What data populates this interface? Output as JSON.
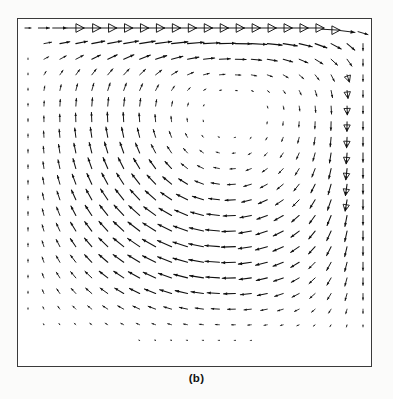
{
  "figure": {
    "caption": "(b)",
    "title": "",
    "frame": {
      "x": 17,
      "y": 18,
      "width": 355,
      "height": 349,
      "border_color": "#3a3a3a",
      "background": "#ffffff"
    },
    "page_background": "#fbfbfa",
    "vector_color": "#111111"
  },
  "chart_data": {
    "type": "scatter",
    "plot_kind": "vector-field-quiver",
    "title": "",
    "subtitle": "",
    "xlabel": "",
    "ylabel": "",
    "xlim": [
      0,
      1
    ],
    "ylim": [
      0,
      1
    ],
    "grid": false,
    "legend": null,
    "annotations": [
      "(b)"
    ],
    "tick_labels": {
      "x": [],
      "y": []
    },
    "grid_nx": 22,
    "grid_ny": 22,
    "vortex_center": {
      "x": 0.605,
      "y": 0.735
    },
    "lid_velocity": {
      "u": 1.0,
      "v": 0.0
    },
    "lid_arrow_style": "large open triangular arrowheads",
    "max_arrow_length_px": 17,
    "reynolds_regime": "primary vortex only, no visible secondary corner eddies",
    "series": [
      {
        "name": "lid row (y = 1.0)",
        "u": [
          0.34,
          0.62,
          0.8,
          0.92,
          1.0,
          1.0,
          1.0,
          1.0,
          1.0,
          1.0,
          1.0,
          1.0,
          1.0,
          1.0,
          1.0,
          1.0,
          1.0,
          1.0,
          1.0,
          1.0,
          0.88,
          0.55
        ],
        "v": [
          0.1,
          0.04,
          0.02,
          0.01,
          0.0,
          0.0,
          0.0,
          0.0,
          0.0,
          0.0,
          0.0,
          0.0,
          0.0,
          0.0,
          0.0,
          0.0,
          0.0,
          0.0,
          0.0,
          -0.02,
          -0.12,
          -0.28
        ]
      },
      {
        "name": "shear layer row (y = 0.95)",
        "u": [
          0.06,
          0.12,
          0.2,
          0.3,
          0.4,
          0.5,
          0.58,
          0.66,
          0.72,
          0.76,
          0.8,
          0.82,
          0.84,
          0.85,
          0.85,
          0.84,
          0.82,
          0.76,
          0.66,
          0.5,
          0.28,
          0.08
        ],
        "v": [
          0.16,
          0.2,
          0.22,
          0.22,
          0.2,
          0.17,
          0.14,
          0.11,
          0.08,
          0.06,
          0.04,
          0.02,
          0.0,
          -0.02,
          -0.05,
          -0.09,
          -0.15,
          -0.24,
          -0.36,
          -0.48,
          -0.52,
          -0.4
        ]
      },
      {
        "name": "upper-mid row (y = 0.80)",
        "u": [
          0.03,
          0.07,
          0.12,
          0.18,
          0.25,
          0.32,
          0.38,
          0.42,
          0.44,
          0.42,
          0.36,
          0.26,
          0.14,
          0.02,
          -0.08,
          -0.16,
          -0.2,
          -0.2,
          -0.16,
          -0.1,
          -0.04,
          -0.01
        ],
        "v": [
          0.12,
          0.18,
          0.22,
          0.25,
          0.26,
          0.25,
          0.22,
          0.17,
          0.1,
          0.02,
          -0.06,
          -0.14,
          -0.22,
          -0.3,
          -0.38,
          -0.46,
          -0.52,
          -0.54,
          -0.5,
          -0.4,
          -0.24,
          -0.08
        ]
      },
      {
        "name": "core row (y = 0.55)",
        "u": [
          0.02,
          0.05,
          0.08,
          0.1,
          0.1,
          0.06,
          0.0,
          -0.08,
          -0.16,
          -0.22,
          -0.26,
          -0.28,
          -0.26,
          -0.22,
          -0.16,
          -0.08,
          0.0,
          0.06,
          0.1,
          0.1,
          0.06,
          0.02
        ],
        "v": [
          0.1,
          0.16,
          0.2,
          0.24,
          0.26,
          0.28,
          0.28,
          0.26,
          0.22,
          0.15,
          0.06,
          -0.04,
          -0.14,
          -0.24,
          -0.33,
          -0.41,
          -0.47,
          -0.5,
          -0.46,
          -0.36,
          -0.2,
          -0.06
        ]
      },
      {
        "name": "lower-mid row (y = 0.30)",
        "u": [
          0.01,
          0.02,
          -0.02,
          -0.08,
          -0.14,
          -0.2,
          -0.25,
          -0.29,
          -0.32,
          -0.34,
          -0.34,
          -0.33,
          -0.3,
          -0.26,
          -0.2,
          -0.13,
          -0.06,
          0.0,
          0.04,
          0.05,
          0.04,
          0.01
        ],
        "v": [
          0.05,
          0.09,
          0.12,
          0.14,
          0.15,
          0.15,
          0.14,
          0.12,
          0.09,
          0.05,
          0.01,
          -0.04,
          -0.09,
          -0.14,
          -0.19,
          -0.24,
          -0.28,
          -0.3,
          -0.28,
          -0.22,
          -0.13,
          -0.04
        ]
      },
      {
        "name": "near-floor row (y = 0.10)",
        "u": [
          0.0,
          -0.01,
          -0.03,
          -0.05,
          -0.07,
          -0.09,
          -0.1,
          -0.11,
          -0.12,
          -0.12,
          -0.12,
          -0.11,
          -0.1,
          -0.09,
          -0.07,
          -0.05,
          -0.03,
          -0.02,
          -0.01,
          0.0,
          0.0,
          0.0
        ],
        "v": [
          0.01,
          0.02,
          0.03,
          0.03,
          0.04,
          0.04,
          0.03,
          0.03,
          0.02,
          0.01,
          0.0,
          -0.01,
          -0.02,
          -0.03,
          -0.04,
          -0.05,
          -0.05,
          -0.05,
          -0.04,
          -0.03,
          -0.01,
          0.0
        ]
      }
    ]
  }
}
